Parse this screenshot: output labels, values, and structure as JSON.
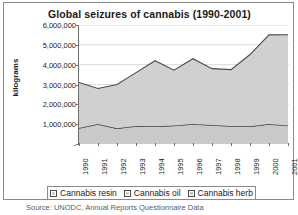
{
  "chart_data": {
    "type": "area",
    "stacked": true,
    "title": "Global seizures of cannabis (1990-2001)",
    "xlabel": "",
    "ylabel": "kilograms",
    "categories": [
      "1990",
      "1991",
      "1992",
      "1993",
      "1994",
      "1995",
      "1996",
      "1997",
      "1998",
      "1999",
      "2000",
      "2001"
    ],
    "ylim": [
      0,
      6000000
    ],
    "ytick_labels": [
      "6,000,000",
      "5,000,000",
      "4,000,000",
      "3,000,000",
      "2,000,000",
      "1,000,000",
      "-"
    ],
    "ytick_values": [
      6000000,
      5000000,
      4000000,
      3000000,
      2000000,
      1000000,
      0
    ],
    "grid": true,
    "legend_position": "bottom",
    "series": [
      {
        "name": "Cannabis resin",
        "color": "#c9c9c9",
        "values": [
          800000,
          1000000,
          780000,
          900000,
          880000,
          920000,
          1000000,
          950000,
          900000,
          880000,
          1000000,
          920000
        ]
      },
      {
        "name": "Cannabis oil",
        "color": "#d4d4d4",
        "values": [
          10000,
          10000,
          10000,
          10000,
          10000,
          10000,
          10000,
          10000,
          10000,
          10000,
          10000,
          10000
        ]
      },
      {
        "name": "Cannabis herb",
        "color": "#d0d0d0",
        "values": [
          2290000,
          1790000,
          2210000,
          2690000,
          3310000,
          2790000,
          3290000,
          2840000,
          2840000,
          3620000,
          4490000,
          4580000
        ]
      }
    ],
    "totals": [
      3100000,
      2800000,
      3000000,
      3600000,
      4200000,
      3720000,
      4300000,
      3800000,
      3750000,
      4510000,
      5500000,
      5510000
    ]
  },
  "legend": {
    "items": [
      {
        "label": "Cannabis resin",
        "color": "#d0d0d0"
      },
      {
        "label": "Cannabis oil",
        "color": "#d0d0d0"
      },
      {
        "label": "Cannabis herb",
        "color": "#c6c6c6"
      }
    ]
  },
  "source": {
    "text": "Source: UNODC, Annual Reports Questionnaire Data"
  },
  "colors": {
    "area_fill": "#d0d0d0",
    "area_line": "#4a4a4a",
    "axis": "#6e6e6e",
    "grid": "#d9d9d9",
    "border": "#8a8a8a",
    "text": "#1a1a1a"
  }
}
